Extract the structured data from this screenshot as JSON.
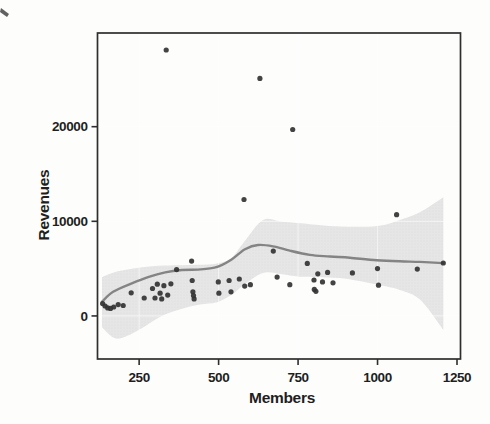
{
  "figure": {
    "kind": "scanned-statistical-plot",
    "x_axis_title": "Members",
    "y_axis_title": "Revenues"
  },
  "chart_data": {
    "type": "scatter",
    "title": "",
    "xlabel": "Members",
    "ylabel": "Revenues",
    "xlim": [
      119,
      1261
    ],
    "ylim": [
      -4550,
      29900
    ],
    "x_ticks": [
      250,
      500,
      750,
      1000,
      1250
    ],
    "y_ticks": [
      0,
      10000,
      20000
    ],
    "grid": "faint",
    "legend": "none",
    "points": [
      [
        135,
        1300
      ],
      [
        143,
        1050
      ],
      [
        151,
        850
      ],
      [
        160,
        800
      ],
      [
        170,
        950
      ],
      [
        184,
        1200
      ],
      [
        200,
        1100
      ],
      [
        225,
        2450
      ],
      [
        266,
        1900
      ],
      [
        292,
        2900
      ],
      [
        300,
        1900
      ],
      [
        307,
        3350
      ],
      [
        316,
        2400
      ],
      [
        321,
        1800
      ],
      [
        328,
        3200
      ],
      [
        340,
        2200
      ],
      [
        350,
        3400
      ],
      [
        335,
        28100
      ],
      [
        368,
        4900
      ],
      [
        415,
        5800
      ],
      [
        417,
        3750
      ],
      [
        419,
        2550
      ],
      [
        421,
        2150
      ],
      [
        423,
        1800
      ],
      [
        499,
        3600
      ],
      [
        501,
        2400
      ],
      [
        533,
        3750
      ],
      [
        539,
        2550
      ],
      [
        565,
        3900
      ],
      [
        582,
        3150
      ],
      [
        600,
        3300
      ],
      [
        580,
        12300
      ],
      [
        630,
        25100
      ],
      [
        672,
        6850
      ],
      [
        684,
        4100
      ],
      [
        724,
        3300
      ],
      [
        733,
        19700
      ],
      [
        779,
        5550
      ],
      [
        800,
        3800
      ],
      [
        801,
        2800
      ],
      [
        806,
        2600
      ],
      [
        812,
        4450
      ],
      [
        827,
        3600
      ],
      [
        843,
        4600
      ],
      [
        860,
        3500
      ],
      [
        921,
        4550
      ],
      [
        1000,
        5000
      ],
      [
        1003,
        3250
      ],
      [
        1060,
        10700
      ],
      [
        1125,
        4950
      ],
      [
        1207,
        5600
      ]
    ],
    "smooth_line": {
      "name": "loess-fit",
      "points": [
        [
          133,
          1500
        ],
        [
          168,
          2550
        ],
        [
          227,
          3450
        ],
        [
          278,
          4100
        ],
        [
          332,
          4600
        ],
        [
          385,
          4850
        ],
        [
          435,
          4900
        ],
        [
          467,
          5000
        ],
        [
          498,
          5200
        ],
        [
          542,
          6000
        ],
        [
          583,
          7050
        ],
        [
          624,
          7500
        ],
        [
          671,
          7350
        ],
        [
          724,
          6900
        ],
        [
          787,
          6450
        ],
        [
          850,
          6280
        ],
        [
          913,
          6150
        ],
        [
          997,
          5880
        ],
        [
          1070,
          5770
        ],
        [
          1133,
          5710
        ],
        [
          1207,
          5580
        ]
      ]
    },
    "confidence_band": {
      "points_m_lower_upper": [
        [
          133,
          -1200,
          4100
        ],
        [
          180,
          -2400,
          4700
        ],
        [
          250,
          -1450,
          5100
        ],
        [
          315,
          -100,
          5300
        ],
        [
          380,
          700,
          5350
        ],
        [
          440,
          1200,
          5400
        ],
        [
          495,
          1450,
          5550
        ],
        [
          540,
          2200,
          6100
        ],
        [
          580,
          3300,
          7800
        ],
        [
          640,
          4550,
          10150
        ],
        [
          700,
          4400,
          9950
        ],
        [
          755,
          4150,
          9800
        ],
        [
          880,
          4000,
          9450
        ],
        [
          1000,
          3300,
          9500
        ],
        [
          1070,
          2750,
          10150
        ],
        [
          1135,
          1700,
          11000
        ],
        [
          1207,
          -1450,
          12550
        ]
      ]
    },
    "colors": {
      "point": "#333333",
      "line": "#848484",
      "band": "#e3e3e3",
      "band_dot": "#c9c9c9",
      "frame": "#2e2e2e",
      "gridline": "#ffffff",
      "text": "#1f1f1f",
      "background": "#fdfdfc"
    }
  }
}
